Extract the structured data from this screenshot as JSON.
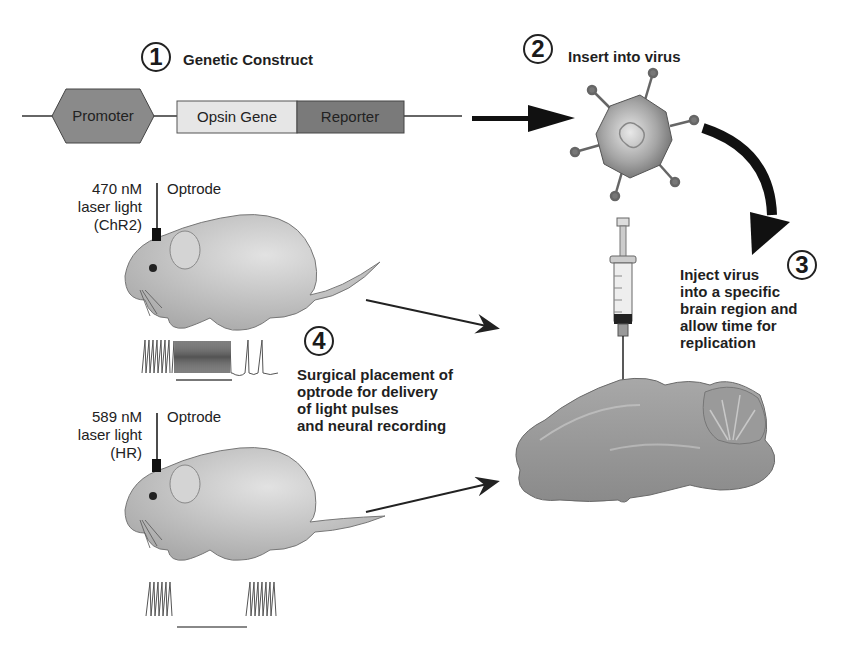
{
  "steps": [
    {
      "number": "1",
      "title": "Genetic Construct"
    },
    {
      "number": "2",
      "title": "Insert into virus"
    },
    {
      "number": "3",
      "lines": [
        "Inject virus",
        "into a specific",
        "brain region and",
        "allow time for",
        "replication"
      ]
    },
    {
      "number": "4",
      "lines": [
        "Surgical placement of",
        "optrode for delivery",
        "of light pulses",
        "and neural recording"
      ]
    }
  ],
  "construct": {
    "promoter": "Promoter",
    "opsin": "Opsin Gene",
    "reporter": "Reporter"
  },
  "mice": [
    {
      "wavelength": "470 nM",
      "light": "laser light",
      "opsin": "(ChR2)",
      "optrode": "Optrode",
      "response": "excitation"
    },
    {
      "wavelength": "589 nM",
      "light": "laser light",
      "opsin": "(HR)",
      "optrode": "Optrode",
      "response": "inhibition"
    }
  ],
  "icons": [
    "virus-icon",
    "syringe-icon",
    "mouse-icon",
    "brain-icon",
    "arrow-icon"
  ],
  "colors": {
    "promoter": "#8a8a8a",
    "opsin": "#e6e6e6",
    "reporter": "#7a7a7a",
    "arrow": "#111111"
  }
}
